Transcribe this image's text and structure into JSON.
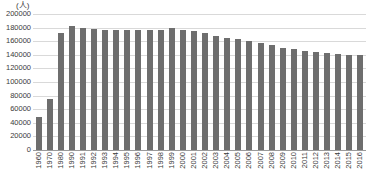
{
  "chart_data": {
    "type": "bar",
    "title": "",
    "subtitle": "",
    "unit_label": "(人)",
    "xlabel": "",
    "ylabel": "",
    "ylim": [
      0,
      200000
    ],
    "ytick_step": 20000,
    "grid": true,
    "legend": null,
    "bar_color": "#6e6e6e",
    "gridline_color": "#d9d9d9",
    "axis_color": "#9a9a9a",
    "text_color": "#3a3a3a",
    "yticks": [
      "0",
      "20000",
      "40000",
      "60000",
      "80000",
      "100000",
      "120000",
      "140000",
      "160000",
      "180000",
      "200000"
    ],
    "categories": [
      "1960",
      "1970",
      "1980",
      "1990",
      "1991",
      "1992",
      "1993",
      "1994",
      "1995",
      "1996",
      "1997",
      "1998",
      "1999",
      "2000",
      "2001",
      "2002",
      "2003",
      "2004",
      "2005",
      "2006",
      "2007",
      "2008",
      "2009",
      "2010",
      "2011",
      "2012",
      "2013",
      "2014",
      "2015",
      "2016"
    ],
    "values": [
      49000,
      75000,
      172000,
      182000,
      180000,
      178000,
      177000,
      176000,
      176000,
      176000,
      177000,
      177000,
      180000,
      177000,
      175000,
      172000,
      168000,
      164000,
      163000,
      160000,
      158000,
      154000,
      150000,
      148000,
      146000,
      144000,
      143000,
      141000,
      140000,
      140000
    ]
  }
}
